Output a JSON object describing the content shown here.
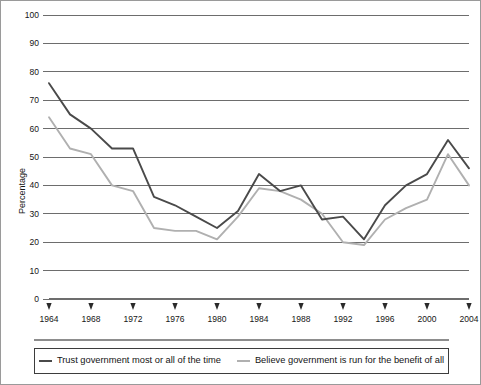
{
  "chart_data": {
    "type": "line",
    "title": "",
    "xlabel": "",
    "ylabel": "Percentage",
    "ylim": [
      0,
      100
    ],
    "xlim": [
      1964,
      2004
    ],
    "ytick_labels": [
      "0",
      "10",
      "20",
      "30",
      "40",
      "50",
      "60",
      "70",
      "80",
      "90",
      "100"
    ],
    "yticks": [
      0,
      10,
      20,
      30,
      40,
      50,
      60,
      70,
      80,
      90,
      100
    ],
    "xtick_labels": [
      "1964",
      "1968",
      "1972",
      "1976",
      "1980",
      "1984",
      "1988",
      "1992",
      "1996",
      "2000",
      "2004"
    ],
    "xticks": [
      1964,
      1968,
      1972,
      1976,
      1980,
      1984,
      1988,
      1992,
      1996,
      2000,
      2004
    ],
    "grid": true,
    "legend_position": "bottom",
    "x": [
      1964,
      1966,
      1968,
      1970,
      1972,
      1974,
      1976,
      1978,
      1980,
      1982,
      1984,
      1986,
      1988,
      1990,
      1992,
      1994,
      1996,
      1998,
      2000,
      2002,
      2004
    ],
    "series": [
      {
        "name": "Trust government most or all of the time",
        "color": "#4a4a4a",
        "values": [
          76,
          65,
          60,
          53,
          53,
          36,
          33,
          29,
          25,
          31,
          44,
          38,
          40,
          28,
          29,
          21,
          33,
          40,
          44,
          56,
          46
        ]
      },
      {
        "name": "Believe government is run for the benefit of all",
        "color": "#b0b0b0",
        "values": [
          64,
          53,
          51,
          40,
          38,
          25,
          24,
          24,
          21,
          29,
          39,
          38,
          35,
          30,
          20,
          19,
          28,
          32,
          35,
          51,
          40
        ]
      }
    ]
  },
  "legend": {
    "entries": [
      {
        "label": "Trust government most or all of the time",
        "color": "#4a4a4a"
      },
      {
        "label": "Believe government is run for the benefit of all",
        "color": "#b0b0b0"
      }
    ]
  },
  "axis": {
    "y_title": "Percentage"
  },
  "colors": {
    "grid": "#6d6d6d",
    "frame": "#9a9a9a",
    "series_dark": "#4a4a4a",
    "series_light": "#b0b0b0"
  }
}
